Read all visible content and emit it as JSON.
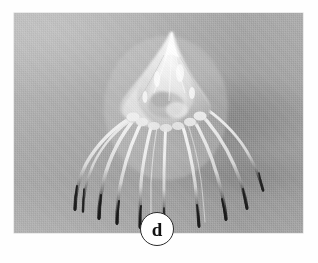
{
  "figure": {
    "panel_label": "d",
    "caption_text": "",
    "background_color": "#ffffff",
    "plate": {
      "image_type": "grayscale-photograph",
      "subject": "jellyfish-medusa-specimen",
      "description": "Conical translucent bell with pointed apex and ten long tentacles that fade from white near the body to dark at the tips, against an out-of-focus gray backdrop.",
      "tone_light": "#f2f2f2",
      "tone_mid": "#a5a5a5",
      "tone_dark": "#1e1e1e",
      "bounds": {
        "x": 14,
        "y": 13,
        "width": 289,
        "height": 220
      }
    },
    "badge": {
      "shape": "circle",
      "diameter": 34,
      "fill_color": "#ffffff",
      "border_color": "#2b2b2b",
      "text_color": "#111111"
    }
  }
}
